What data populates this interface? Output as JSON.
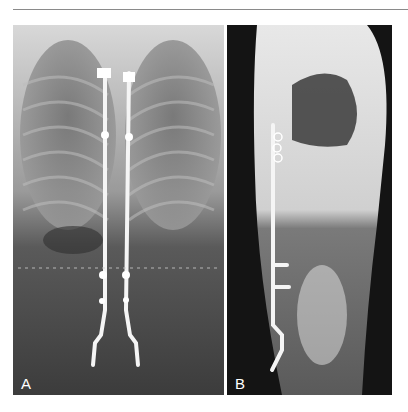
{
  "figure": {
    "panels": [
      {
        "id": "A",
        "label": "A",
        "view": "anteroposterior radiograph",
        "background": "#4a4a4a"
      },
      {
        "id": "B",
        "label": "B",
        "view": "lateral radiograph",
        "background": "#141414"
      }
    ]
  }
}
